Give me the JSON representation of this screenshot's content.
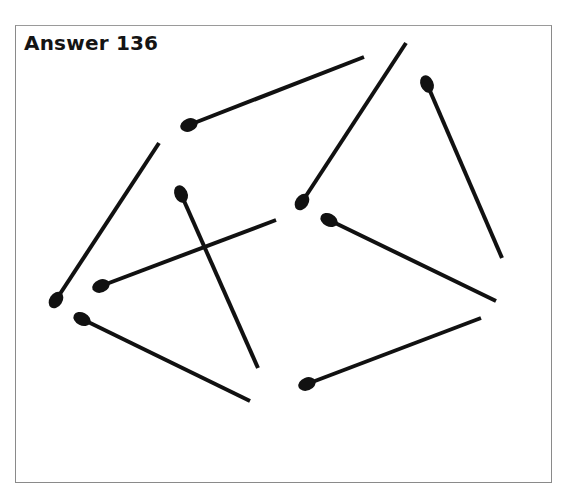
{
  "title": "Answer 136",
  "colors": {
    "match": "#111111",
    "frame": "#8a8a8a",
    "background": "#ffffff"
  },
  "matches": [
    {
      "head": [
        189,
        125
      ],
      "tail": [
        364,
        57
      ]
    },
    {
      "head": [
        302,
        202
      ],
      "tail": [
        406,
        43
      ]
    },
    {
      "head": [
        427,
        84
      ],
      "tail": [
        502,
        258
      ]
    },
    {
      "head": [
        329,
        220
      ],
      "tail": [
        496,
        301
      ]
    },
    {
      "head": [
        307,
        384
      ],
      "tail": [
        481,
        318
      ]
    },
    {
      "head": [
        56,
        300
      ],
      "tail": [
        159,
        143
      ]
    },
    {
      "head": [
        181,
        194
      ],
      "tail": [
        258,
        368
      ]
    },
    {
      "head": [
        101,
        286
      ],
      "tail": [
        276,
        220
      ]
    },
    {
      "head": [
        82,
        319
      ],
      "tail": [
        250,
        401
      ]
    }
  ]
}
